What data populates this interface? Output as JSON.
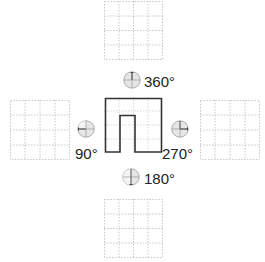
{
  "diagram": {
    "title": "",
    "center_shape": {
      "description": "rectilinear outline shape with a notch open at the bottom",
      "stroke": "#333333"
    },
    "grid": {
      "cells": 4,
      "line_color": "#c8c8c8"
    },
    "rotations": [
      {
        "id": "top",
        "label": "360°",
        "degrees": 360
      },
      {
        "id": "left",
        "label": "90°",
        "degrees": 90
      },
      {
        "id": "right",
        "label": "270°",
        "degrees": 270
      },
      {
        "id": "bottom",
        "label": "180°",
        "degrees": 180
      }
    ],
    "colors": {
      "dial_fill": "#e6e6e6",
      "dial_stroke": "#9a9a9a",
      "dial_hand": "#444444",
      "text": "#222222"
    }
  }
}
